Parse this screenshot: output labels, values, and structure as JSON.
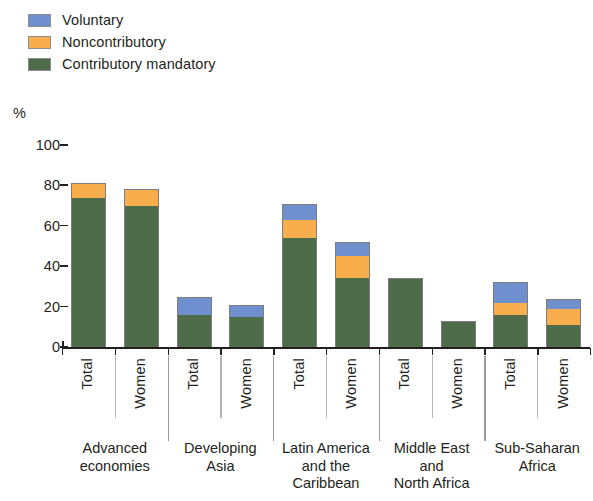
{
  "legend": {
    "items": [
      {
        "label": "Voluntary",
        "color": "#6f8fcf",
        "key": "voluntary"
      },
      {
        "label": "Noncontributory",
        "color": "#f9ae4e",
        "key": "noncontributory"
      },
      {
        "label": "Contributory mandatory",
        "color": "#4e6b4a",
        "key": "contributory_mandatory"
      }
    ]
  },
  "axis": {
    "unit_label": "%",
    "y_ticks": [
      "100",
      "80",
      "60",
      "40",
      "20",
      "0"
    ]
  },
  "bars": [
    {
      "series_label": "Total",
      "group": "Advanced economies"
    },
    {
      "series_label": "Women",
      "group": "Advanced economies"
    },
    {
      "series_label": "Total",
      "group": "Developing Asia"
    },
    {
      "series_label": "Women",
      "group": "Developing Asia"
    },
    {
      "series_label": "Total",
      "group": "Latin America and the Caribbean"
    },
    {
      "series_label": "Women",
      "group": "Latin America and the Caribbean"
    },
    {
      "series_label": "Total",
      "group": "Middle East and North Africa"
    },
    {
      "series_label": "Women",
      "group": "Middle East and North Africa"
    },
    {
      "series_label": "Total",
      "group": "Sub-Saharan Africa"
    },
    {
      "series_label": "Women",
      "group": "Sub-Saharan Africa"
    }
  ],
  "group_labels": [
    "Advanced\neconomies",
    "Developing\nAsia",
    "Latin America\nand the\nCaribbean",
    "Middle East\nand\nNorth Africa",
    "Sub-Saharan\nAfrica"
  ],
  "chart_data": {
    "type": "bar",
    "stacked": true,
    "title": "",
    "subtitle": "",
    "xlabel": "",
    "ylabel": "%",
    "ylim": [
      0,
      100
    ],
    "yticks": [
      0,
      20,
      40,
      60,
      80,
      100
    ],
    "grid": false,
    "legend_position": "top-left",
    "categories": [
      "Advanced economies – Total",
      "Advanced economies – Women",
      "Developing Asia – Total",
      "Developing Asia – Women",
      "Latin America and the Caribbean – Total",
      "Latin America and the Caribbean – Women",
      "Middle East and North Africa – Total",
      "Middle East and North Africa – Women",
      "Sub-Saharan Africa – Total",
      "Sub-Saharan Africa – Women"
    ],
    "groups": [
      "Advanced economies",
      "Developing Asia",
      "Latin America and the Caribbean",
      "Middle East and North Africa",
      "Sub-Saharan Africa"
    ],
    "subcategories": [
      "Total",
      "Women"
    ],
    "series": [
      {
        "name": "Contributory mandatory",
        "color": "#4e6b4a",
        "values": [
          74,
          70,
          16,
          15,
          54,
          34,
          34,
          13,
          16,
          11
        ]
      },
      {
        "name": "Noncontributory",
        "color": "#f9ae4e",
        "values": [
          7,
          8,
          0,
          0,
          9,
          11,
          0,
          0,
          6,
          8
        ]
      },
      {
        "name": "Voluntary",
        "color": "#6f8fcf",
        "values": [
          0,
          0,
          9,
          6,
          8,
          7,
          0,
          0,
          10,
          5
        ]
      }
    ],
    "totals": [
      81,
      78,
      25,
      21,
      71,
      52,
      34,
      13,
      32,
      24
    ]
  }
}
